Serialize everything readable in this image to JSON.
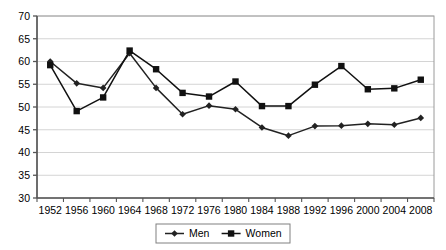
{
  "chart_data": {
    "type": "line",
    "title": "",
    "xlabel": "",
    "ylabel": "",
    "grid": "horizontal",
    "legend_position": "bottom-center",
    "ylim": [
      30,
      70
    ],
    "yticks": [
      30,
      35,
      40,
      45,
      50,
      55,
      60,
      65,
      70
    ],
    "categories": [
      "1952",
      "1956",
      "1960",
      "1964",
      "1968",
      "1972",
      "1976",
      "1980",
      "1984",
      "1988",
      "1992",
      "1996",
      "2000",
      "2004",
      "2008"
    ],
    "series": [
      {
        "name": "Men",
        "marker": "diamond",
        "color": "#222222",
        "values": [
          60.0,
          55.2,
          54.2,
          61.8,
          54.2,
          48.4,
          50.3,
          49.5,
          45.5,
          43.7,
          45.8,
          45.9,
          46.3,
          46.1,
          47.6
        ]
      },
      {
        "name": "Women",
        "marker": "square",
        "color": "#111111",
        "values": [
          59.2,
          49.1,
          52.1,
          62.4,
          58.3,
          53.1,
          52.3,
          55.6,
          50.2,
          50.2,
          54.9,
          59.0,
          53.9,
          54.1,
          56.0
        ]
      }
    ]
  },
  "legend": {
    "items": [
      {
        "label": "Men"
      },
      {
        "label": "Women"
      }
    ]
  }
}
